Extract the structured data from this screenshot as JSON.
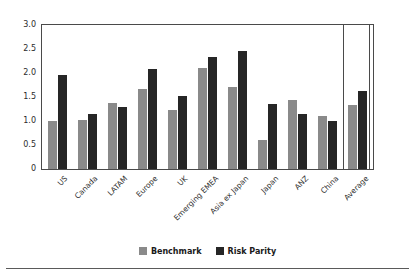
{
  "chart_data": {
    "type": "bar",
    "title": "",
    "subtitle": "",
    "xlabel": "",
    "ylabel": "",
    "ylim": [
      0,
      3.0
    ],
    "yticks": [
      "0",
      "0.5",
      "1.0",
      "1.5",
      "2.0",
      "2.5",
      "3.0"
    ],
    "ytick_values": [
      0,
      0.5,
      1.0,
      1.5,
      2.0,
      2.5,
      3.0
    ],
    "grid": false,
    "legend_position": "bottom-center",
    "categories": [
      "US",
      "Canada",
      "LATAM",
      "Europe",
      "UK",
      "Emerging EMEA",
      "Asia ex Japan",
      "Japan",
      "ANZ",
      "China",
      "Average"
    ],
    "series": [
      {
        "name": "Benchmark",
        "color": "#8a8a8a",
        "values": [
          0.99,
          1.02,
          1.38,
          1.66,
          1.23,
          2.1,
          1.7,
          0.61,
          1.44,
          1.11,
          1.34
        ]
      },
      {
        "name": "Risk Parity",
        "color": "#262626",
        "values": [
          1.95,
          1.15,
          1.3,
          2.08,
          1.52,
          2.33,
          2.45,
          1.36,
          1.14,
          1.01,
          1.63
        ]
      }
    ],
    "annotations": [
      {
        "type": "separator",
        "label": "Average group divider",
        "after_category": "China"
      }
    ]
  }
}
